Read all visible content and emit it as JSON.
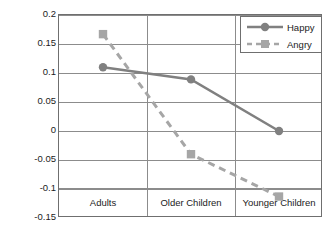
{
  "chart_data": {
    "type": "line",
    "title": "",
    "xlabel": "",
    "ylabel": "% Signal Change",
    "categories": [
      "Adults",
      "Older Children",
      "Younger Children"
    ],
    "series": [
      {
        "name": "Happy",
        "values": [
          0.11,
          0.089,
          0.0
        ],
        "color": "#808080",
        "line_style": "solid",
        "marker": "circle"
      },
      {
        "name": "Angry",
        "values": [
          0.167,
          -0.04,
          -0.113
        ],
        "color": "#a6a6a6",
        "line_style": "dashed",
        "marker": "square"
      }
    ],
    "ylim": [
      -0.15,
      0.2
    ],
    "yticks": [
      0.2,
      0.15,
      0.1,
      0.05,
      0,
      -0.05,
      -0.1,
      -0.15
    ],
    "ytick_labels": [
      "0.2",
      "0.15",
      "0.1",
      "0.05",
      "0",
      "-0.05",
      "-0.1",
      "-0.15"
    ],
    "grid": true,
    "grid_axis": "y",
    "legend_position": "top-right",
    "legend_entries": [
      "Happy",
      "Angry"
    ],
    "annotations": []
  },
  "axis": {
    "y_title": "% Signal Change"
  },
  "legend": {
    "happy_label": "Happy",
    "angry_label": "Angry"
  }
}
